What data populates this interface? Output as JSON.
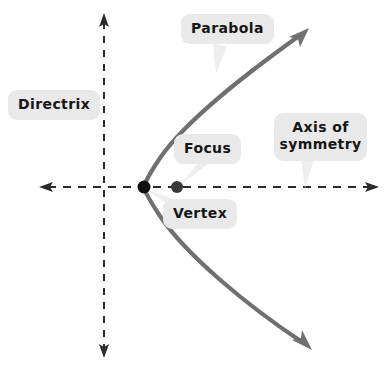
{
  "diagram": {
    "type": "parabola-anatomy",
    "background_color": "#ffffff",
    "curve_color": "#707070",
    "axis_color": "#2b2b2b",
    "label_background_color": "#e9e9e9",
    "label_text_color": "#161616",
    "point_color": "#111111"
  },
  "labels": {
    "directrix": "Directrix",
    "parabola": "Parabola",
    "focus": "Focus",
    "vertex": "Vertex",
    "axis_of_symmetry_line1": "Axis of",
    "axis_of_symmetry_line2": "symmetry"
  },
  "geometry": {
    "vertex_point": {
      "x": 144,
      "y": 187
    },
    "focus_point": {
      "x": 177,
      "y": 187
    },
    "axis_of_symmetry": {
      "x1": 40,
      "y1": 187,
      "x2": 378,
      "y2": 187,
      "style": "dashed",
      "arrows": "both"
    },
    "directrix_line": {
      "x1": 104,
      "y1": 15,
      "x2": 104,
      "y2": 356,
      "style": "dashed",
      "arrows": "both"
    },
    "parabola_opens": "right",
    "parabola_upper_endpoint": {
      "x": 306,
      "y": 30
    },
    "parabola_lower_endpoint": {
      "x": 309,
      "y": 347
    }
  }
}
